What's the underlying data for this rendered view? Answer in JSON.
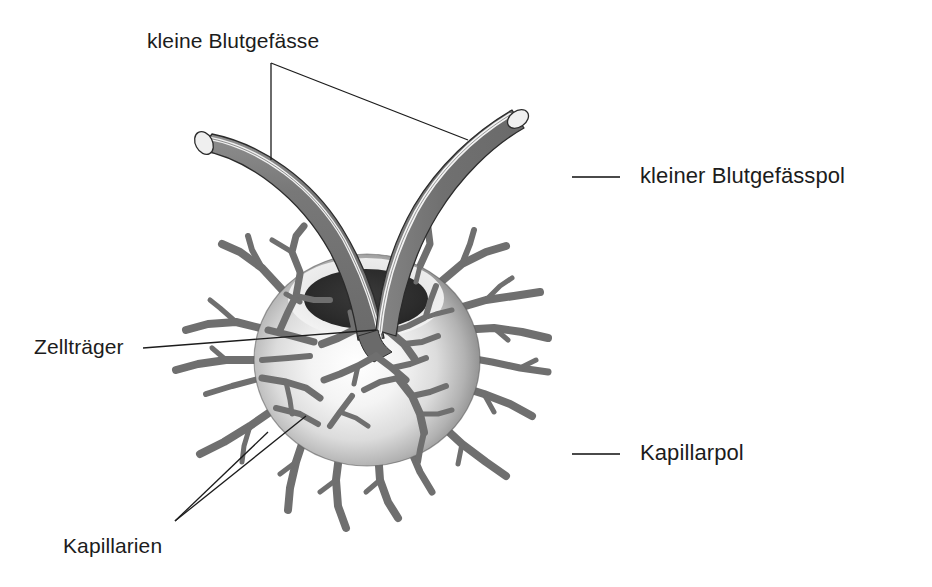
{
  "figure": {
    "background_color": "#ffffff",
    "line_color": "#1c1c1c",
    "vessel_fill": "#6e6e6e",
    "vessel_highlight": "#f2f2f2",
    "capillary_color": "#6b6b6b",
    "sphere_light": "#fdfdfd",
    "sphere_mid": "#c9c9c9",
    "sphere_dark": "#6a6a6a",
    "crater_color": "#2f2f2f"
  },
  "labels": {
    "kleine_blutgefaesse": "kleine Blutgefässe",
    "zelltraeger": "Zellträger",
    "kapillarien": "Kapillarien",
    "kleiner_blutgefaesspol": "kleiner Blutgefässpol",
    "kapillarpol": "Kapillarpol"
  },
  "annotations": [
    {
      "name": "kleine-blutgefaesse",
      "text": "kleine Blutgefässe",
      "position": "top-left",
      "leader": "two-branch, vertical to left vessel and diagonal to right vessel"
    },
    {
      "name": "zelltraeger",
      "text": "Zellträger",
      "position": "left-middle",
      "leader": "single straight line to sphere body"
    },
    {
      "name": "kapillarien",
      "text": "Kapillarien",
      "position": "bottom-left",
      "leader": "two-branch converging at lower-left point"
    },
    {
      "name": "kleiner-blutgefaesspol",
      "text": "kleiner Blutgefässpol",
      "position": "right-upper",
      "leader": "short horizontal dash"
    },
    {
      "name": "kapillarpol",
      "text": "Kapillarpol",
      "position": "right-lower",
      "leader": "short horizontal dash"
    }
  ],
  "structures": {
    "sphere": {
      "center_x": 367,
      "center_y": 360,
      "radius_x": 113,
      "radius_y": 106
    },
    "crater": {
      "center_x": 366,
      "center_y": 298,
      "radius_x": 63,
      "radius_y": 31
    },
    "vessel_left": {
      "tip_x": 196,
      "tip_y": 152
    },
    "vessel_right": {
      "tip_x": 519,
      "tip_y": 120
    },
    "capillary_count": 22
  }
}
